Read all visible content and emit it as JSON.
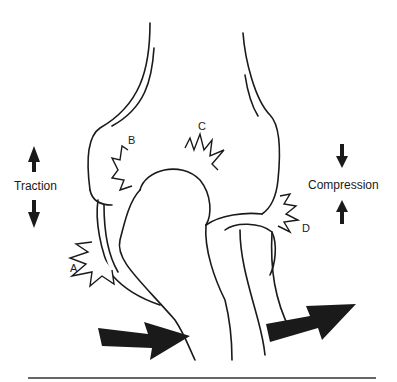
{
  "figure": {
    "labels": {
      "traction": "Traction",
      "compression": "Compression",
      "site_a": "A",
      "site_b": "B",
      "site_c": "C",
      "site_d": "D"
    },
    "colors": {
      "line": "#1a1a1a",
      "background": "#ffffff"
    }
  }
}
